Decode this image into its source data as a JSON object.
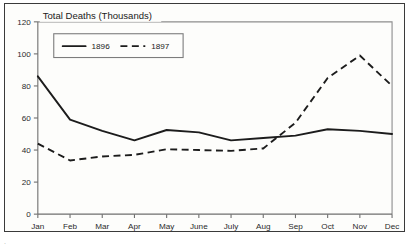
{
  "figure": {
    "title": "Total Deaths (Thousands)",
    "frame_color": "#3a3a3a",
    "background_color": "#fdfdfb"
  },
  "legend": {
    "position": "upper-left-inside",
    "entries": [
      {
        "label": "1896",
        "style": "solid"
      },
      {
        "label": "1897",
        "style": "dashed"
      }
    ]
  },
  "caption": {
    "text": "."
  },
  "chart_data": {
    "type": "line",
    "title": "Total Deaths (Thousands)",
    "xlabel": "",
    "ylabel": "",
    "ylim": [
      0,
      120
    ],
    "yticks": [
      0,
      20,
      40,
      60,
      80,
      100,
      120
    ],
    "ytick_labels": [
      "0",
      "20",
      "40",
      "60",
      "80",
      "100",
      "120"
    ],
    "grid": false,
    "legend_position": "upper left",
    "categories": [
      "Jan",
      "Feb",
      "Mar",
      "Apr",
      "May",
      "June",
      "July",
      "Aug",
      "Sep",
      "Oct",
      "Nov",
      "Dec"
    ],
    "series": [
      {
        "name": "1896",
        "style": "solid",
        "color": "#1c1c1c",
        "values": [
          86,
          59,
          52,
          46,
          52.5,
          51,
          46,
          47.5,
          49,
          53,
          52,
          50
        ]
      },
      {
        "name": "1897",
        "style": "dashed",
        "color": "#1c1c1c",
        "values": [
          44,
          33.5,
          36,
          37,
          40.5,
          40,
          39.5,
          41,
          57,
          85,
          99,
          80
        ]
      }
    ]
  }
}
